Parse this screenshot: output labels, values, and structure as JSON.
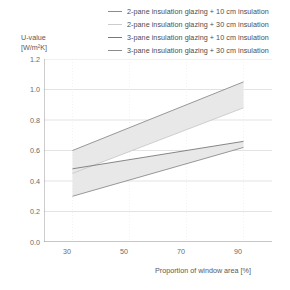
{
  "chart_data": {
    "type": "area",
    "title": "",
    "xlabel": "Proportion of window area [%]",
    "ylabel_line1": "U-value",
    "ylabel_line2": "[W/m²K]",
    "x": [
      30,
      90
    ],
    "xlim": [
      20,
      100
    ],
    "ylim": [
      0.0,
      1.2
    ],
    "xticks": [
      30,
      50,
      70,
      90
    ],
    "yticks": [
      "0.0",
      "0.2",
      "0.4",
      "0.6",
      "0.8",
      "1.0",
      "1.2"
    ],
    "ytick_values": [
      0.0,
      0.2,
      0.4,
      0.6,
      0.8,
      1.0,
      1.2
    ],
    "grid": true,
    "legend_position": "top-right",
    "series": [
      {
        "name": "2-pane insulation glazing + 10 cm insulation",
        "color": "#8c8c8c",
        "values": [
          0.6,
          1.05
        ]
      },
      {
        "name": "2-pane insulation glazing + 30 cm insulation",
        "color": "#c9c9c9",
        "values": [
          0.45,
          0.88
        ]
      },
      {
        "name": "3-pane insulation glazing + 10 cm insulation",
        "color": "#7a7a7a",
        "values": [
          0.48,
          0.66
        ]
      },
      {
        "name": "3-pane insulation glazing + 30 cm insulation",
        "color": "#8c8c8c",
        "values": [
          0.3,
          0.62
        ]
      }
    ],
    "bands": [
      {
        "name": "2-pane band",
        "upper": [
          0.6,
          1.05
        ],
        "lower": [
          0.45,
          0.88
        ],
        "fill": "#e8e8e8"
      },
      {
        "name": "3-pane band",
        "upper": [
          0.48,
          0.66
        ],
        "lower": [
          0.3,
          0.62
        ],
        "fill": "#e8e8e8"
      }
    ]
  },
  "legend": {
    "items": [
      {
        "label": "2-pane insulation glazing + 10 cm insulation",
        "color": "#8c8c8c"
      },
      {
        "label": "2-pane insulation glazing + 30 cm insulation",
        "color": "#cccccc"
      },
      {
        "label": "3-pane insulation glazing + 10 cm insulation",
        "color": "#787878"
      },
      {
        "label": "3-pane insulation glazing + 30 cm insulation",
        "color": "#8c8c8c"
      }
    ]
  },
  "axes": {
    "y_title_line1": "U-value",
    "y_title_line2": "[W/m²K]",
    "x_title": "Proportion of window area [%]",
    "y_ticks": [
      "1.2",
      "1.0",
      "0.8",
      "0.6",
      "0.4",
      "0.2",
      "0.0"
    ],
    "x_ticks": [
      "30",
      "50",
      "70",
      "90"
    ]
  },
  "colors": {
    "grid": "#dcdcdc",
    "axis": "#9a9a9a",
    "band_fill": "#e9e9e9",
    "text": "#6b6b6b"
  }
}
